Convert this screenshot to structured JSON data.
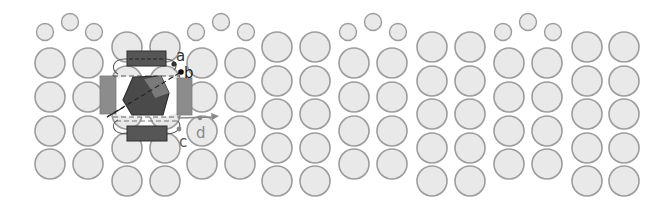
{
  "diagram": {
    "colors": {
      "atom_fill": "#e9e9e9",
      "atom_stroke": "#9c9c9c",
      "dark_block": "#555555",
      "gray_block": "#8c8c8c",
      "hexagon": "#4a4a4a",
      "hexagon_facet": "#7a7a7a",
      "label_dark": "#333333",
      "label_gray": "#8a8a8a"
    },
    "lattice": {
      "radius_large": 15,
      "radius_small": 8.5,
      "row_spacing": 33.5,
      "high_groups": [
        {
          "columns": [
            50,
            88
          ],
          "small": [
            [
              45,
              32
            ],
            [
              70,
              22
            ],
            [
              94,
              32
            ]
          ]
        },
        {
          "columns": [
            202,
            240
          ],
          "small": [
            [
              196,
              32
            ],
            [
              221,
              22
            ],
            [
              246,
              32
            ]
          ]
        },
        {
          "columns": [
            354,
            392
          ],
          "small": [
            [
              348,
              32
            ],
            [
              373,
              22
            ],
            [
              398,
              32
            ]
          ]
        },
        {
          "columns": [
            509,
            547
          ],
          "small": [
            [
              503,
              32
            ],
            [
              528,
              22
            ],
            [
              553,
              32
            ]
          ]
        }
      ],
      "high_rows": [
        63,
        97,
        131,
        164
      ],
      "low_groups": [
        {
          "columns": [
            127,
            165
          ]
        },
        {
          "columns": [
            277,
            315
          ]
        },
        {
          "columns": [
            432,
            470
          ]
        },
        {
          "columns": [
            587,
            624
          ]
        }
      ],
      "low_rows": [
        47,
        81,
        114,
        148,
        181
      ]
    },
    "labels": {
      "a": "a",
      "b": "b",
      "c": "c",
      "d": "d"
    }
  }
}
